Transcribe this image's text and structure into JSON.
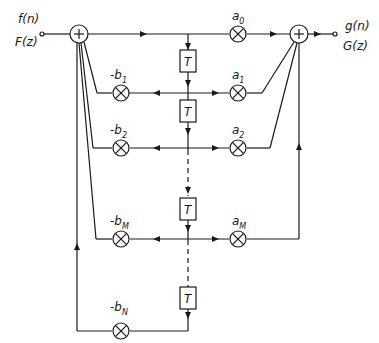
{
  "diagram": {
    "type": "IIR filter signal-flow structure",
    "input": {
      "time": "f(n)",
      "z": "F(z)"
    },
    "output": {
      "time": "g(n)",
      "z": "G(z)"
    },
    "delay_label": "T",
    "feedforward": [
      {
        "name": "a",
        "sub": "0"
      },
      {
        "name": "a",
        "sub": "1"
      },
      {
        "name": "a",
        "sub": "2"
      },
      {
        "name": "a",
        "sub": "M"
      }
    ],
    "feedback": [
      {
        "name": "-b",
        "sub": "1"
      },
      {
        "name": "-b",
        "sub": "2"
      },
      {
        "name": "-b",
        "sub": "M"
      },
      {
        "name": "-b",
        "sub": "N"
      }
    ],
    "colors": {
      "line": "#1a1a1a",
      "background": "#ffffff"
    }
  }
}
